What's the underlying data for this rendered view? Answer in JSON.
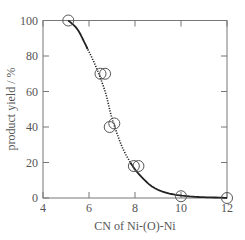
{
  "chart_data": {
    "type": "scatter",
    "title": "",
    "xlabel": "CN of Ni-(O)-Ni",
    "ylabel": "product yield / %",
    "xlim": [
      4,
      12
    ],
    "ylim": [
      0,
      100
    ],
    "xticks": [
      4,
      6,
      8,
      10,
      12
    ],
    "yticks": [
      0,
      20,
      40,
      60,
      80,
      100
    ],
    "grid": false,
    "legend": null,
    "series": [
      {
        "name": "data",
        "marker": "open-circle",
        "points": [
          {
            "x": 5.1,
            "y": 100
          },
          {
            "x": 6.5,
            "y": 70
          },
          {
            "x": 6.7,
            "y": 70
          },
          {
            "x": 6.9,
            "y": 40
          },
          {
            "x": 7.1,
            "y": 42
          },
          {
            "x": 7.95,
            "y": 18
          },
          {
            "x": 8.15,
            "y": 18
          },
          {
            "x": 10.0,
            "y": 1
          },
          {
            "x": 12.0,
            "y": 0
          }
        ]
      },
      {
        "name": "fit-curve",
        "style": "solid (dotted between ~5.9 and ~7.8)",
        "points": [
          {
            "x": 5.1,
            "y": 100
          },
          {
            "x": 5.5,
            "y": 95
          },
          {
            "x": 5.9,
            "y": 85
          },
          {
            "x": 6.3,
            "y": 74
          },
          {
            "x": 6.7,
            "y": 60
          },
          {
            "x": 7.0,
            "y": 45
          },
          {
            "x": 7.4,
            "y": 30
          },
          {
            "x": 7.8,
            "y": 20
          },
          {
            "x": 8.2,
            "y": 13
          },
          {
            "x": 8.8,
            "y": 6
          },
          {
            "x": 9.5,
            "y": 2.5
          },
          {
            "x": 10.5,
            "y": 0.8
          },
          {
            "x": 12.0,
            "y": 0.1
          }
        ]
      }
    ]
  }
}
